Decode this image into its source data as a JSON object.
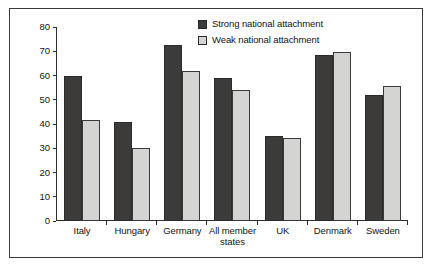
{
  "chart_data": {
    "type": "bar",
    "title": "",
    "xlabel": "",
    "ylabel": "% support for EU",
    "ylim": [
      0,
      80
    ],
    "yticks": [
      0,
      10,
      20,
      30,
      40,
      50,
      60,
      70,
      80
    ],
    "grid": false,
    "legend_position": "top-right",
    "categories": [
      "Italy",
      "Hungary",
      "Germany",
      "All member states",
      "UK",
      "Denmark",
      "Sweden"
    ],
    "series": [
      {
        "name": "Strong national attachment",
        "color": "#3d3a3a",
        "values": [
          60,
          41,
          72.5,
          59,
          35,
          68.5,
          52
        ]
      },
      {
        "name": "Weak national attachment",
        "color": "#d4d4d2",
        "values": [
          41.5,
          30,
          62,
          54,
          34.3,
          69.5,
          55.5
        ]
      }
    ]
  },
  "legend": {
    "entries": [
      {
        "label": "Strong national attachment",
        "swatch": "strong"
      },
      {
        "label": "Weak national attachment",
        "swatch": "weak"
      }
    ]
  }
}
